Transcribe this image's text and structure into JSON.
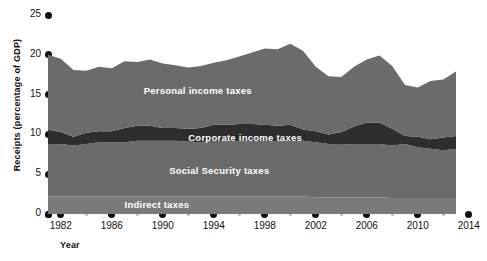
{
  "chart_data": {
    "type": "area",
    "title": "",
    "subtitle": "",
    "xlabel": "Year",
    "ylabel": "Receipts (percentage of GDP)",
    "stacked": true,
    "grid": false,
    "legend_position": "inline-annotations",
    "xlim": [
      1981,
      2013
    ],
    "ylim": [
      0,
      25
    ],
    "ytick_labels": [
      "0",
      "5",
      "10",
      "15",
      "20",
      "25"
    ],
    "ytick_values": [
      0,
      5,
      10,
      15,
      20,
      25
    ],
    "xtick_labels": [
      "1982",
      "1986",
      "1990",
      "1994",
      "1998",
      "2002",
      "2006",
      "2010",
      "2014"
    ],
    "xtick_values": [
      1982,
      1986,
      1990,
      1994,
      1998,
      2002,
      2006,
      2010,
      2014
    ],
    "xminor_values": [
      1984,
      1988,
      1992,
      1996,
      2000,
      2004,
      2008,
      2012
    ],
    "x": [
      1981,
      1982,
      1983,
      1984,
      1985,
      1986,
      1987,
      1988,
      1989,
      1990,
      1991,
      1992,
      1993,
      1994,
      1995,
      1996,
      1997,
      1998,
      1999,
      2000,
      2001,
      2002,
      2003,
      2004,
      2005,
      2006,
      2007,
      2008,
      2009,
      2010,
      2011,
      2012,
      2013
    ],
    "series": [
      {
        "name": "Indirect taxes",
        "color": "#7a7a7a",
        "values": [
          2.2,
          2.2,
          2.2,
          2.2,
          2.2,
          2.2,
          2.2,
          2.2,
          2.2,
          2.2,
          2.2,
          2.2,
          2.2,
          2.2,
          2.2,
          2.2,
          2.2,
          2.2,
          2.2,
          2.2,
          2.2,
          2.1,
          2.1,
          2.1,
          2.1,
          2.1,
          2.1,
          2.0,
          2.0,
          2.0,
          2.0,
          2.0,
          2.0
        ]
      },
      {
        "name": "Social Security taxes",
        "color": "#6b6b6b",
        "values": [
          6.6,
          6.6,
          6.4,
          6.6,
          6.8,
          6.8,
          6.8,
          7.0,
          7.0,
          7.0,
          7.0,
          6.9,
          6.8,
          7.0,
          6.9,
          6.9,
          6.9,
          6.9,
          6.9,
          6.9,
          7.0,
          6.9,
          6.7,
          6.6,
          6.7,
          6.7,
          6.7,
          6.6,
          6.8,
          6.4,
          6.2,
          6.0,
          6.2
        ]
      },
      {
        "name": "Corporate income taxes",
        "color": "#2e2e2e",
        "values": [
          1.8,
          1.5,
          1.1,
          1.4,
          1.4,
          1.4,
          1.8,
          1.9,
          1.9,
          1.6,
          1.6,
          1.6,
          1.8,
          2.0,
          2.1,
          2.2,
          2.2,
          2.1,
          2.0,
          2.1,
          1.4,
          1.4,
          1.2,
          1.6,
          2.2,
          2.7,
          2.7,
          2.1,
          1.0,
          1.3,
          1.2,
          1.6,
          1.6
        ]
      },
      {
        "name": "Personal income taxes",
        "color": "#6b6b6b",
        "values": [
          9.4,
          9.2,
          8.4,
          7.8,
          8.1,
          7.9,
          8.4,
          8.0,
          8.3,
          8.1,
          7.9,
          7.7,
          7.8,
          7.8,
          8.1,
          8.5,
          9.0,
          9.6,
          9.6,
          10.2,
          9.9,
          8.1,
          7.3,
          6.9,
          7.5,
          7.9,
          8.4,
          7.9,
          6.4,
          6.2,
          7.3,
          7.3,
          8.1
        ]
      }
    ],
    "annotations": [
      {
        "text": "Personal income taxes",
        "x": 1988.5,
        "y": 15.5
      },
      {
        "text": "Corporate income taxes",
        "x": 1992.0,
        "y": 9.6
      },
      {
        "text": "Social Security taxes",
        "x": 1990.5,
        "y": 5.4
      },
      {
        "text": "Indirect taxes",
        "x": 1987.0,
        "y": 1.1
      }
    ]
  },
  "style": {
    "background": "#ffffff",
    "tick_dot_color": "#111111",
    "minor_dot_color": "#b9b9b9",
    "text_color": "#111111",
    "label_color": "#ffffff"
  }
}
